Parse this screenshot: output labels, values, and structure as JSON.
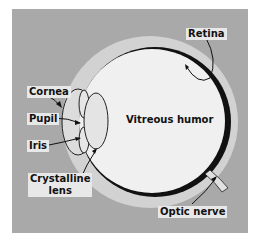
{
  "diagram": {
    "labels": {
      "cornea": "Cornea",
      "pupil": "Pupil",
      "iris": "Iris",
      "crystalline_lens_line1": "Crystalline",
      "crystalline_lens_line2": "lens",
      "vitreous_humor": "Vitreous humor",
      "retina": "Retina",
      "optic_nerve": "Optic nerve"
    },
    "colors": {
      "background_panel": "#a9a9a9",
      "sclera": "#d4d4d4",
      "vitreous": "#f0f0f0",
      "retina": "#111111",
      "label_bg": "#e8e8e8"
    }
  }
}
